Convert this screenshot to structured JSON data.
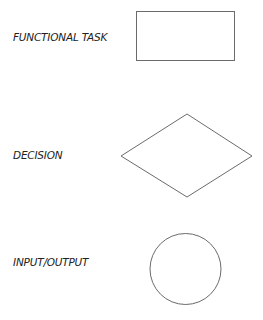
{
  "diagram": {
    "type": "flowchart-legend",
    "stroke_color": "#6b6b6b",
    "items": [
      {
        "label": "FUNCTIONAL TASK",
        "shape": "rectangle"
      },
      {
        "label": "DECISION",
        "shape": "diamond"
      },
      {
        "label": "INPUT/OUTPUT",
        "shape": "circle"
      }
    ]
  }
}
